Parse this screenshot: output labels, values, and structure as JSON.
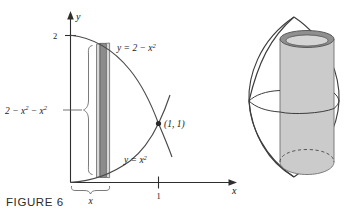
{
  "figure": {
    "caption": "FIGURE 6",
    "axes": {
      "y_axis_label": "y",
      "x_axis_label": "x",
      "y_tick_label": "2",
      "x_tick_label": "1"
    },
    "curves": [
      {
        "id": "upper",
        "label": "y = 2 − x",
        "label_exponent": "2"
      },
      {
        "id": "lower",
        "label": "y = x",
        "label_exponent": "2"
      }
    ],
    "annotations": {
      "intersection_point": "(1, 1)",
      "shell_height_prefix": "2 − x",
      "shell_height_exp1": "2",
      "shell_height_mid": " − x",
      "shell_height_exp2": "2",
      "shell_width_label": "x"
    },
    "colors": {
      "curve": "#4a4a4a",
      "axis": "#2e2e2e",
      "shell_fill": "#8c8c8c",
      "shell_edge_fill": "#d8d8d8",
      "solid_outline": "#3d3d3d",
      "cylinder_body": "#cbcbcb",
      "cylinder_top_ring": "#8f8f8f",
      "background": "#ffffff"
    },
    "solid_figure": {
      "description": "cylindrical-shell-in-solid-of-revolution"
    }
  }
}
